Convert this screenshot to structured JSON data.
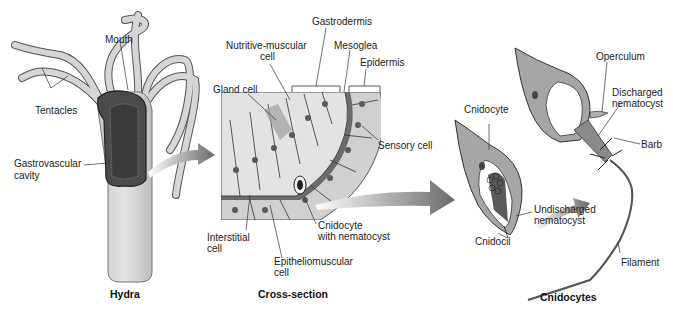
{
  "panels": {
    "hydra": {
      "caption": "Hydra",
      "labels": {
        "mouth": "Mouth",
        "tentacles": "Tentacles",
        "gastrovascular_1": "Gastrovascular",
        "gastrovascular_2": "cavity"
      }
    },
    "cross_section": {
      "caption": "Cross-section",
      "labels": {
        "gastrodermis": "Gastrodermis",
        "nutritive_1": "Nutritive-muscular",
        "nutritive_2": "cell",
        "mesoglea": "Mesoglea",
        "epidermis": "Epidermis",
        "gland": "Gland cell",
        "sensory": "Sensory cell",
        "interstitial_1": "Interstitial",
        "interstitial_2": "cell",
        "cnidocyte_1": "Cnidocyte",
        "cnidocyte_2": "with nematocyst",
        "epithelio_1": "Epitheliomuscular",
        "epithelio_2": "cell"
      }
    },
    "cnidocytes": {
      "caption": "Cnidocytes",
      "labels": {
        "operculum": "Operculum",
        "discharged_1": "Discharged",
        "discharged_2": "nematocyst",
        "barb": "Barb",
        "cnidocyte": "Cnidocyte",
        "undischarged_1": "Undischarged",
        "undischarged_2": "nematocyst",
        "cnidocil": "Cnidocil",
        "filament": "Filament"
      }
    }
  },
  "colors": {
    "tissue_light": "#d4d4d4",
    "tissue_mid": "#a9a9a9",
    "tissue_dark": "#6e6e6e",
    "outline": "#2a2a2a",
    "arrow": "#7a7a7a"
  }
}
